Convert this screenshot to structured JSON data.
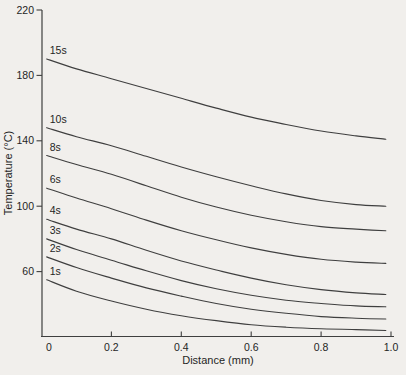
{
  "page": {
    "background": "#f1efec"
  },
  "chart_data": {
    "type": "line",
    "title": "",
    "xlabel": "Distance (mm)",
    "ylabel": "Temperature (°C)",
    "xlim": [
      0,
      1
    ],
    "ylim": [
      20,
      220
    ],
    "grid": false,
    "legend": "inline-labels-at-curve-start",
    "line_color": "#3f3f3f",
    "text_color": "#1f1f1f",
    "origin_tick_label": "0",
    "x_ticks": [
      {
        "value": 0.2,
        "label": "0.2"
      },
      {
        "value": 0.4,
        "label": "0.4"
      },
      {
        "value": 0.6,
        "label": "0.6"
      },
      {
        "value": 0.8,
        "label": "0.8"
      },
      {
        "value": 1.0,
        "label": "1.0"
      }
    ],
    "y_ticks": [
      {
        "value": 60,
        "label": "60"
      },
      {
        "value": 100,
        "label": "100"
      },
      {
        "value": 140,
        "label": "140"
      },
      {
        "value": 180,
        "label": "180"
      },
      {
        "value": 220,
        "label": "220"
      }
    ],
    "x": [
      0.015,
      0.1,
      0.2,
      0.3,
      0.4,
      0.5,
      0.6,
      0.7,
      0.8,
      0.9,
      0.985
    ],
    "series": [
      {
        "name": "15s",
        "values": [
          190,
          184,
          178,
          172,
          166,
          160,
          154.5,
          150,
          146,
          143,
          141
        ]
      },
      {
        "name": "10s",
        "values": [
          148,
          142.5,
          137,
          130.5,
          124,
          118,
          112.5,
          107.5,
          103.5,
          101,
          100
        ]
      },
      {
        "name": "8s",
        "values": [
          131,
          125.5,
          119.5,
          112.5,
          105.5,
          99.5,
          94.5,
          90.5,
          87.5,
          86,
          85
        ]
      },
      {
        "name": "6s",
        "values": [
          111,
          105,
          98.5,
          91.5,
          85,
          79.5,
          74.5,
          70.5,
          67.5,
          65.8,
          65
        ]
      },
      {
        "name": "4s",
        "values": [
          92,
          86,
          80,
          73,
          66.5,
          61,
          56,
          52,
          49,
          47,
          46
        ]
      },
      {
        "name": "3s",
        "values": [
          80,
          73.5,
          67,
          60.5,
          54.5,
          49.5,
          45.5,
          42.5,
          40.5,
          39,
          38.5
        ]
      },
      {
        "name": "2s",
        "values": [
          69,
          62.5,
          56,
          50,
          45,
          40.5,
          37,
          34.5,
          32.5,
          31.5,
          31
        ]
      },
      {
        "name": "1s",
        "values": [
          55,
          48,
          42,
          37,
          33,
          30,
          27.5,
          26,
          25,
          24.5,
          24
        ]
      }
    ]
  }
}
